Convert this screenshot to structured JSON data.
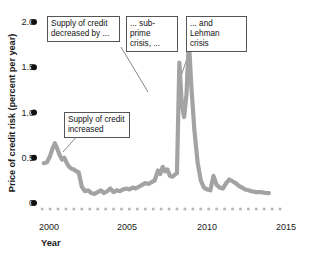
{
  "figure": {
    "background_color": "#ffffff",
    "line_color": "#a3a3a3",
    "text_color": "#1a1a1a",
    "box_border_color": "#555555",
    "tick_dot_color": "#111111",
    "minor_tick_color": "#b8b8b8"
  },
  "axes": {
    "y_title": "Price of credit risk (percent per year)",
    "x_title": "Year",
    "y_ticks": [
      "0",
      "0.5",
      "1.0",
      "1.5",
      "2.0"
    ],
    "x_ticks": [
      "2000",
      "2005",
      "2010",
      "2015"
    ]
  },
  "annotations": [
    {
      "id": "supply-decreased",
      "line1": "Supply of credit",
      "line2": "decreased by ..."
    },
    {
      "id": "subprime",
      "line1": "... sub-prime",
      "line2": "crisis, ..."
    },
    {
      "id": "lehman",
      "line1": "... and Lehman",
      "line2": "crisis"
    },
    {
      "id": "supply-increased",
      "line1": "Supply of credit",
      "line2": "increased"
    }
  ],
  "chart_data": {
    "type": "line",
    "title": "",
    "xlabel": "Year",
    "ylabel": "Price of credit risk (percent per year)",
    "xlim": [
      1999.6,
      2015.3
    ],
    "ylim": [
      0,
      2.05
    ],
    "grid": false,
    "legend": null,
    "series": [
      {
        "name": "Price of credit risk",
        "color": "#a3a3a3",
        "x": [
          1999.9,
          2000.1,
          2000.3,
          2000.45,
          2000.6,
          2000.75,
          2000.9,
          2001.05,
          2001.2,
          2001.35,
          2001.5,
          2001.65,
          2001.8,
          2001.95,
          2002.1,
          2002.3,
          2002.5,
          2002.7,
          2002.9,
          2003.1,
          2003.3,
          2003.5,
          2003.7,
          2003.9,
          2004.1,
          2004.3,
          2004.5,
          2004.7,
          2004.9,
          2005.1,
          2005.3,
          2005.5,
          2005.7,
          2005.9,
          2006.1,
          2006.3,
          2006.5,
          2006.7,
          2006.9,
          2007.1,
          2007.25,
          2007.4,
          2007.55,
          2007.7,
          2007.85,
          2008.0,
          2008.15,
          2008.3,
          2008.45,
          2008.6,
          2008.75,
          2008.9,
          2009.05,
          2009.2,
          2009.4,
          2009.6,
          2009.8,
          2010.0,
          2010.2,
          2010.4,
          2010.6,
          2010.8,
          2011.0,
          2011.2,
          2011.4,
          2011.6,
          2011.8,
          2012.0,
          2012.2,
          2012.4,
          2012.6,
          2012.8,
          2013.0,
          2013.3,
          2013.6,
          2013.9,
          2014.1
        ],
        "y": [
          0.44,
          0.45,
          0.52,
          0.6,
          0.66,
          0.6,
          0.53,
          0.48,
          0.5,
          0.44,
          0.4,
          0.38,
          0.37,
          0.35,
          0.34,
          0.18,
          0.13,
          0.14,
          0.11,
          0.1,
          0.12,
          0.14,
          0.11,
          0.13,
          0.16,
          0.12,
          0.14,
          0.13,
          0.15,
          0.16,
          0.15,
          0.17,
          0.16,
          0.18,
          0.2,
          0.22,
          0.21,
          0.23,
          0.25,
          0.36,
          0.32,
          0.4,
          0.35,
          0.37,
          0.3,
          0.29,
          0.31,
          0.33,
          1.55,
          1.1,
          0.95,
          1.2,
          1.8,
          1.3,
          0.8,
          0.45,
          0.25,
          0.17,
          0.15,
          0.14,
          0.3,
          0.2,
          0.17,
          0.16,
          0.22,
          0.26,
          0.24,
          0.22,
          0.19,
          0.17,
          0.15,
          0.14,
          0.13,
          0.12,
          0.12,
          0.11,
          0.11
        ]
      }
    ],
    "annotations": [
      {
        "text": "Supply of credit decreased by ...",
        "points_to_x": 2006.0,
        "points_to_y": 1.95
      },
      {
        "text": "... sub-prime crisis, ...",
        "points_to_x": 2008.45,
        "points_to_y": 1.55
      },
      {
        "text": "... and Lehman crisis",
        "points_to_x": 2009.05,
        "points_to_y": 1.8
      },
      {
        "text": "Supply of credit increased",
        "points_to_x": 2000.8,
        "points_to_y": 0.6
      }
    ]
  }
}
